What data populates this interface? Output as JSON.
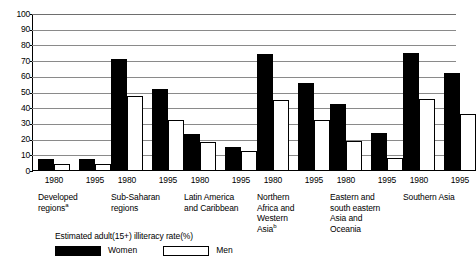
{
  "chart_data": {
    "type": "bar",
    "title": "",
    "subtitle": "",
    "xlabel": "",
    "ylabel": "",
    "ylim": [
      0,
      100
    ],
    "yticks": [
      0,
      10,
      20,
      30,
      40,
      50,
      60,
      70,
      80,
      90,
      100
    ],
    "grid": true,
    "legend_position": "below-plot",
    "legend_title": "Estimated adult(15+) illiteracy rate(%)",
    "categories": [
      "Developed regions",
      "Sub-Saharan regions",
      "Latin America and Caribbean",
      "Northern Africa and Western Asia",
      "Eastern and south eastern Asia and Oceania",
      "Southern Asia"
    ],
    "years": [
      "1980",
      "1995"
    ],
    "series": [
      {
        "name": "Women",
        "color": "#000000",
        "values_1980": [
          7.5,
          71.2,
          23.5,
          74.5,
          42.5,
          75.0
        ],
        "values_1995": [
          7.5,
          52.0,
          15.0,
          56.0,
          24.0,
          62.5
        ]
      },
      {
        "name": "Men",
        "color": "#ffffff",
        "values_1980": [
          4.5,
          48.0,
          18.5,
          45.0,
          19.0,
          46.0
        ],
        "values_1995": [
          4.5,
          32.5,
          12.5,
          32.5,
          8.5,
          36.0
        ]
      }
    ],
    "annotations": [
      "Superscript a on 'Developed regions'",
      "Superscript b on 'Western Asia'"
    ]
  },
  "axis": {
    "yticks": [
      "100",
      "90",
      "80",
      "70",
      "60",
      "50",
      "40",
      "30",
      "20",
      "10",
      "0"
    ]
  },
  "groups": [
    {
      "region_line1": "Developed",
      "region_line2": "regions",
      "footnote": "a",
      "years": [
        "1980",
        "1995"
      ],
      "women": [
        7.5,
        7.5
      ],
      "men": [
        4.5,
        4.5
      ]
    },
    {
      "region_line1": "Sub-Saharan",
      "region_line2": "regions",
      "footnote": "",
      "years": [
        "1980",
        "1995"
      ],
      "women": [
        71.2,
        52.0
      ],
      "men": [
        48.0,
        32.5
      ]
    },
    {
      "region_line1": "Latin America",
      "region_line2": "and Caribbean",
      "footnote": "",
      "years": [
        "1980",
        "1995"
      ],
      "women": [
        23.5,
        15.0
      ],
      "men": [
        18.5,
        12.5
      ]
    },
    {
      "region_line1": "Northern",
      "region_line2": "Africa and\nWestern\nAsia",
      "footnote": "b",
      "years": [
        "1980",
        "1995"
      ],
      "women": [
        74.5,
        56.0
      ],
      "men": [
        45.0,
        32.5
      ]
    },
    {
      "region_line1": "Eastern and",
      "region_line2": "south eastern\nAsia and\nOceania",
      "footnote": "",
      "years": [
        "1980",
        "1995"
      ],
      "women": [
        42.5,
        24.0
      ],
      "men": [
        19.0,
        8.5
      ]
    },
    {
      "region_line1": "Southern Asia",
      "region_line2": "",
      "footnote": "",
      "years": [
        "1980",
        "1995"
      ],
      "women": [
        75.0,
        62.5
      ],
      "men": [
        46.0,
        36.0
      ]
    }
  ],
  "legend": {
    "title": "Estimated adult(15+) illiteracy rate(%)",
    "women_label": "Women",
    "men_label": "Men"
  }
}
